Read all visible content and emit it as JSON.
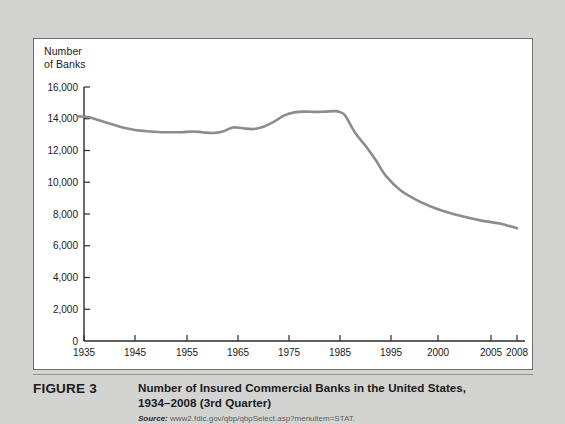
{
  "figure": {
    "label": "FIGURE 3",
    "title": "Number of Insured Commercial Banks in the United States,\n1934–2008 (3rd Quarter)",
    "source_label": "Source:",
    "source_text": "www2.fdic.gov/qbp/qbpSelect.asp?menuitem=STAT."
  },
  "chart_data": {
    "type": "line",
    "title": "Number of Insured Commercial Banks in the United States, 1934–2008 (3rd Quarter)",
    "xlabel": "",
    "ylabel": "Number\nof Banks",
    "ylim": [
      0,
      16000
    ],
    "xlim": [
      1934,
      2008
    ],
    "grid": false,
    "legend": "none",
    "line_color": "#8c8c8c",
    "axis_color": "#2b2b2b",
    "yticks": [
      0,
      2000,
      4000,
      6000,
      8000,
      10000,
      12000,
      14000,
      16000
    ],
    "ytick_labels": [
      "0",
      "2,000",
      "4,000",
      "6,000",
      "8,000",
      "10,000",
      "12,000",
      "14,000",
      "16,000"
    ],
    "xticks": [
      1935,
      1945,
      1955,
      1965,
      1975,
      1985,
      1995,
      2000,
      2005,
      2008
    ],
    "xtick_labels": [
      "1935",
      "1945",
      "1955",
      "1965",
      "1975",
      "1985",
      "1995",
      "2000",
      "2005",
      "2008"
    ],
    "xtick_positions": [
      83,
      134,
      186,
      237,
      288,
      339,
      390,
      437,
      490,
      516
    ],
    "series": [
      {
        "name": "Insured commercial banks",
        "x": [
          1934,
          1936,
          1938,
          1940,
          1942,
          1944,
          1946,
          1948,
          1950,
          1952,
          1954,
          1956,
          1958,
          1960,
          1962,
          1964,
          1966,
          1968,
          1970,
          1972,
          1974,
          1976,
          1978,
          1980,
          1982,
          1984,
          1985,
          1986,
          1988,
          1990,
          1992,
          1994,
          1996,
          1998,
          2000,
          2002,
          2004,
          2006,
          2008
        ],
        "values": [
          14150,
          14100,
          13900,
          13700,
          13500,
          13350,
          13250,
          13200,
          13150,
          13150,
          13150,
          13200,
          13150,
          13100,
          13200,
          13450,
          13400,
          13350,
          13500,
          13800,
          14200,
          14400,
          14450,
          14430,
          14450,
          14480,
          14420,
          14200,
          13100,
          12300,
          11400,
          10400,
          9500,
          8800,
          8300,
          7900,
          7600,
          7400,
          7100
        ]
      }
    ],
    "annotations": []
  }
}
